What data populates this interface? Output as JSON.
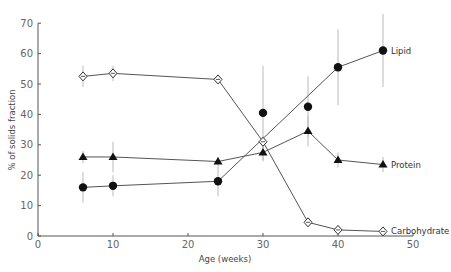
{
  "chart_data": {
    "type": "line",
    "title": "",
    "xlabel": "Age (weeks)",
    "ylabel": "% of solids fraction",
    "xlim": [
      0,
      50
    ],
    "ylim": [
      0,
      70
    ],
    "xticks": [
      0,
      10,
      20,
      30,
      40,
      50
    ],
    "yticks": [
      0,
      10,
      20,
      30,
      40,
      50,
      60,
      70
    ],
    "grid": false,
    "legend_position": "inline labels at right end of series",
    "series": [
      {
        "name": "Carbohydrate",
        "marker": "open-diamond",
        "x": [
          6,
          10,
          24,
          30,
          36,
          40,
          46
        ],
        "values": [
          52.5,
          53.5,
          51.5,
          31,
          4.5,
          2,
          1.5
        ],
        "error": [
          3.5,
          2.5,
          1.5,
          2,
          1.5,
          1.5,
          1.5
        ]
      },
      {
        "name": "Protein",
        "marker": "filled-triangle",
        "x": [
          6,
          10,
          24,
          30,
          36,
          40,
          46
        ],
        "values": [
          26,
          26,
          24.5,
          27.5,
          34.5,
          25,
          23.5
        ],
        "error": [
          2,
          5,
          1.5,
          3,
          5,
          2.5,
          2.5
        ]
      },
      {
        "name": "Lipid",
        "marker": "filled-circle",
        "x": [
          6,
          10,
          24,
          40,
          46
        ],
        "values": [
          16,
          16.5,
          18,
          55.5,
          61
        ],
        "error": [
          5,
          3.5,
          5,
          12.5,
          12
        ],
        "unconnected_points": [
          {
            "x": 30,
            "value": 40.5,
            "error": 15.5
          },
          {
            "x": 36,
            "value": 42.5,
            "error": 10
          }
        ]
      }
    ]
  }
}
